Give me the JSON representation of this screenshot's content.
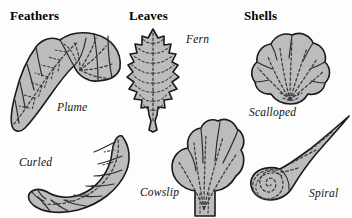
{
  "plate": {
    "background_color": "#fdfdfd",
    "shape_fill_color": "#bcbcbc",
    "outline_color": "#1a1a1a",
    "detail_line_color": "#3a3a3a"
  },
  "columns": [
    {
      "heading": "Feathers",
      "figures": [
        {
          "label": "Plume",
          "shape": "curved-plume-feather"
        },
        {
          "label": "Curled",
          "shape": "crescent-curled-feather"
        }
      ]
    },
    {
      "heading": "Leaves",
      "figures": [
        {
          "label": "Fern",
          "shape": "serrated-fern-leaf"
        },
        {
          "label": "Cowslip",
          "shape": "lobed-fan-cowslip-leaf"
        }
      ]
    },
    {
      "heading": "Shells",
      "figures": [
        {
          "label": "Scalloped",
          "shape": "scalloped-shell"
        },
        {
          "label": "Spiral",
          "shape": "spiral-cone-shell"
        }
      ]
    }
  ]
}
